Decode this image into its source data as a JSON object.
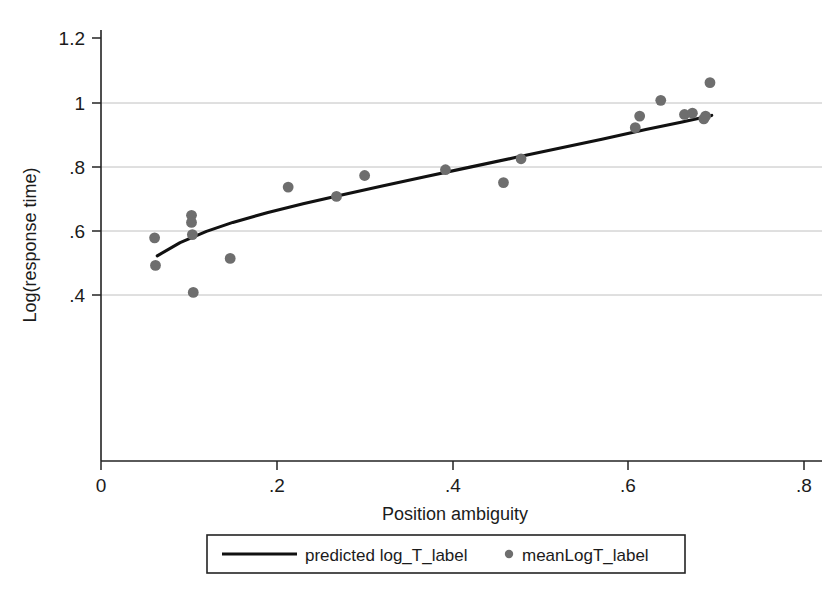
{
  "chart_data": {
    "type": "scatter",
    "title": "",
    "xlabel": "Position ambiguity",
    "ylabel": "Log(response time)",
    "xlim": [
      0,
      0.8
    ],
    "ylim": [
      0.28,
      1.26
    ],
    "xticks": [
      0,
      0.2,
      0.4,
      0.6,
      0.8
    ],
    "xticklabels": [
      "0",
      ".2",
      ".4",
      ".6",
      ".8"
    ],
    "yticks": [
      0.4,
      0.6,
      0.8,
      1.0,
      1.2
    ],
    "yticklabels": [
      ".4",
      ".6",
      ".8",
      "1",
      "1.2"
    ],
    "grid": "horizontal",
    "legend_position": "below-axis",
    "series": [
      {
        "name": "meanLogT_label",
        "type": "scatter",
        "marker": "circle",
        "color": "#6e6e6e",
        "points": [
          {
            "x": 0.061,
            "y": 0.578
          },
          {
            "x": 0.062,
            "y": 0.492
          },
          {
            "x": 0.103,
            "y": 0.648
          },
          {
            "x": 0.103,
            "y": 0.626
          },
          {
            "x": 0.104,
            "y": 0.588
          },
          {
            "x": 0.105,
            "y": 0.408
          },
          {
            "x": 0.147,
            "y": 0.514
          },
          {
            "x": 0.213,
            "y": 0.736
          },
          {
            "x": 0.268,
            "y": 0.707
          },
          {
            "x": 0.3,
            "y": 0.772
          },
          {
            "x": 0.392,
            "y": 0.79
          },
          {
            "x": 0.458,
            "y": 0.75
          },
          {
            "x": 0.478,
            "y": 0.824
          },
          {
            "x": 0.608,
            "y": 0.921
          },
          {
            "x": 0.613,
            "y": 0.957
          },
          {
            "x": 0.637,
            "y": 1.006
          },
          {
            "x": 0.664,
            "y": 0.962
          },
          {
            "x": 0.673,
            "y": 0.966
          },
          {
            "x": 0.686,
            "y": 0.948
          },
          {
            "x": 0.688,
            "y": 0.957
          },
          {
            "x": 0.693,
            "y": 1.061
          }
        ]
      },
      {
        "name": "predicted log_T_label",
        "type": "line",
        "color": "#111111",
        "points": [
          {
            "x": 0.064,
            "y": 0.522
          },
          {
            "x": 0.09,
            "y": 0.563
          },
          {
            "x": 0.12,
            "y": 0.598
          },
          {
            "x": 0.15,
            "y": 0.626
          },
          {
            "x": 0.19,
            "y": 0.657
          },
          {
            "x": 0.23,
            "y": 0.684
          },
          {
            "x": 0.27,
            "y": 0.709
          },
          {
            "x": 0.32,
            "y": 0.739
          },
          {
            "x": 0.37,
            "y": 0.769
          },
          {
            "x": 0.42,
            "y": 0.798
          },
          {
            "x": 0.47,
            "y": 0.827
          },
          {
            "x": 0.52,
            "y": 0.856
          },
          {
            "x": 0.57,
            "y": 0.885
          },
          {
            "x": 0.62,
            "y": 0.915
          },
          {
            "x": 0.66,
            "y": 0.938
          },
          {
            "x": 0.695,
            "y": 0.959
          }
        ]
      }
    ]
  },
  "legend": {
    "items": [
      {
        "marker": "line",
        "label": "predicted log_T_label"
      },
      {
        "marker": "dot",
        "label": "meanLogT_label"
      }
    ]
  }
}
